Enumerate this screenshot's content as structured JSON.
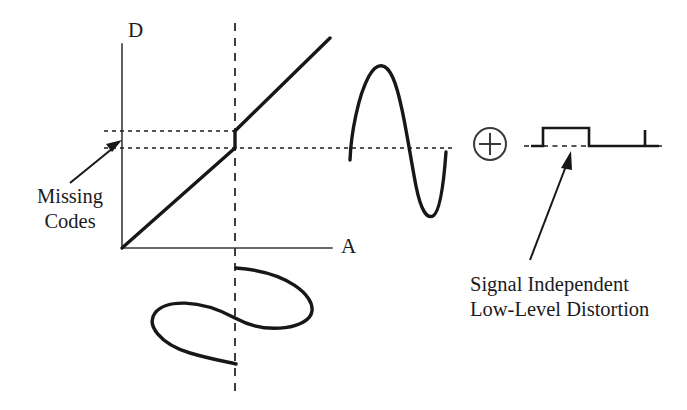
{
  "figure": {
    "domain": "Diagram",
    "background_color": "#ffffff",
    "ink_color": "#17171a",
    "axis_color": "#3a3a3a"
  },
  "axes": {
    "y_label": "D",
    "x_label": "A",
    "y_label_meaning": "digital-output-axis",
    "x_label_meaning": "analog-input-axis",
    "origin": {
      "x": 122,
      "y": 248
    },
    "y_axis_top": {
      "x": 122,
      "y": 44
    },
    "x_axis_right": {
      "x": 332,
      "y": 248
    }
  },
  "annotations": {
    "missing_codes": {
      "line1": "Missing",
      "line2": "Codes",
      "full_text": "Missing Codes",
      "arrow_from": {
        "x": 78,
        "y": 178
      },
      "arrow_to": {
        "x": 123,
        "y": 143
      }
    },
    "signal_distortion": {
      "line1": "Signal Independent",
      "line2": "Low-Level Distortion",
      "full_text": "Signal Independent Low-Level Distortion",
      "arrow_from": {
        "x": 530,
        "y": 257
      },
      "arrow_to": {
        "x": 571,
        "y": 152
      }
    }
  },
  "operator": {
    "symbol": "plus-in-circle",
    "glyph": "⊕",
    "meaning": "summation",
    "center": {
      "x": 490,
      "y": 144
    },
    "radius": 16
  },
  "transfer_curve": {
    "name": "adc-transfer-function-with-missing-codes",
    "description": "Linear ramp with a vertical discontinuity (code jump) at the dashed vertical marker",
    "lower_segment": {
      "x1": 122,
      "y1": 248,
      "x2": 235,
      "y2": 148
    },
    "discontinuity": {
      "x": 235,
      "y_low": 148,
      "y_high": 131
    },
    "upper_segment": {
      "x1": 235,
      "y1": 131,
      "x2": 330,
      "y2": 38
    }
  },
  "reference_lines": {
    "upper_dashed_level": {
      "y": 131,
      "x1": 104,
      "x2": 236,
      "label": "upper-code-level"
    },
    "lower_dashed_level": {
      "y": 148,
      "x1": 104,
      "x2": 453,
      "label": "lower-code-level"
    },
    "vertical_marker": {
      "x": 235,
      "y1": 23,
      "y2": 395,
      "label": "input-operating-point"
    },
    "distortion_baseline": {
      "y": 146,
      "x1": 526,
      "x2": 664,
      "label": "distortion-zero-level"
    }
  },
  "waveforms": {
    "input_sine": {
      "name": "input-analog-sine",
      "orientation": "horizontal-sine-about-vertical-axis",
      "center_x": 235,
      "y_start": 268,
      "y_end": 365,
      "amplitude": 78
    },
    "output_sine": {
      "name": "output-distorted-sine",
      "orientation": "vertical-sine-about-horizontal-axis",
      "baseline_y": 153,
      "x_start": 349,
      "x_end": 447,
      "amplitude": 90
    },
    "distortion_square": {
      "name": "low-level-square-distortion",
      "baseline_y": 146,
      "pulse_high_y": 128,
      "segments": [
        {
          "x1": 526,
          "x2": 543,
          "level": "baseline"
        },
        {
          "x1": 543,
          "x2": 543,
          "level": "rise"
        },
        {
          "x1": 543,
          "x2": 589,
          "level": "high"
        },
        {
          "x1": 589,
          "x2": 589,
          "level": "fall"
        },
        {
          "x1": 589,
          "x2": 645,
          "level": "baseline"
        },
        {
          "x1": 645,
          "x2": 645,
          "level": "tick-up"
        },
        {
          "x1": 645,
          "x2": 664,
          "level": "baseline"
        }
      ]
    }
  }
}
